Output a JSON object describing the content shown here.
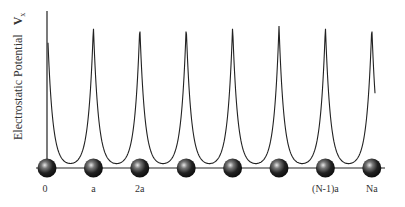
{
  "figure": {
    "ylabel": "Electrostatic Potential",
    "ylabel_symbol": "V",
    "ylabel_subscript": "x",
    "axis_color": "#222222",
    "curve_color": "#222222",
    "ion_color": "#1a1a1a",
    "ion_highlight": "#dddddd"
  },
  "chart_data": {
    "type": "line",
    "title": "",
    "xlabel": "",
    "ylabel": "Electrostatic Potential V_x",
    "ion_sites": [
      0,
      1,
      2,
      3,
      4,
      5,
      6,
      7
    ],
    "peak_relative_height": [
      1.08,
      1.0,
      1.0,
      1.0,
      1.0,
      1.0,
      1.0,
      1.0
    ],
    "x_tick_labels": [
      {
        "site": 0,
        "label": "0"
      },
      {
        "site": 1,
        "label": "a"
      },
      {
        "site": 2,
        "label": "2a"
      },
      {
        "site": 6,
        "label": "(N-1)a"
      },
      {
        "site": 7,
        "label": "Na"
      }
    ]
  }
}
